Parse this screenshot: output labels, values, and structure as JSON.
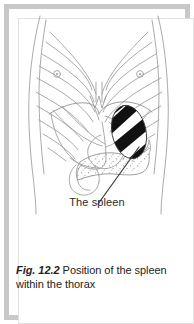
{
  "figure": {
    "label": "The spleen",
    "caption_number": "Fig. 12.2",
    "caption_text": "Position of the spleen within the thorax",
    "colors": {
      "frame": "#c8c8c8",
      "background": "#ffffff",
      "outline": "#9a9a9a",
      "organ_outline": "#8d8d8d",
      "spleen_stripe": "#111111",
      "leader_line": "#3a3a3a",
      "text": "#232323"
    },
    "structures": [
      {
        "name": "torso-outline",
        "label": "torso outline"
      },
      {
        "name": "ribcage-left",
        "label": "left ribcage"
      },
      {
        "name": "ribcage-right",
        "label": "right ribcage"
      },
      {
        "name": "sternum-xiphoid",
        "label": "sternum and xiphoid process"
      },
      {
        "name": "costal-margin",
        "label": "costal margin"
      },
      {
        "name": "diaphragm",
        "label": "diaphragm"
      },
      {
        "name": "liver",
        "label": "liver"
      },
      {
        "name": "stomach",
        "label": "stomach"
      },
      {
        "name": "pancreas",
        "label": "pancreas"
      },
      {
        "name": "duodenum",
        "label": "duodenum"
      },
      {
        "name": "spleen",
        "label": "spleen"
      },
      {
        "name": "nipple-left",
        "label": "left nipple"
      },
      {
        "name": "nipple-right",
        "label": "right nipple"
      },
      {
        "name": "leader-line",
        "label": "leader line from label to spleen"
      }
    ],
    "spleen": {
      "shading": "diagonal black and white bands",
      "band_count": 4,
      "position_description": "upper left abdominal quadrant beneath the left ribs"
    }
  }
}
